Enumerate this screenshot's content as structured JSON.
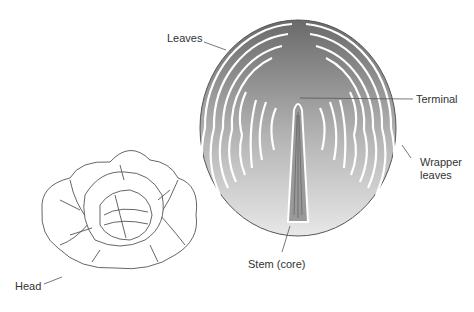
{
  "diagram": {
    "labels": {
      "leaves": "Leaves",
      "terminal": "Terminal",
      "wrapper_line1": "Wrapper",
      "wrapper_line2": "leaves",
      "stem": "Stem (core)",
      "head": "Head"
    },
    "colors": {
      "line": "#555555",
      "fill_dark": "#6e6e6e",
      "fill_light": "#e6e6e6",
      "text": "#333333"
    }
  }
}
